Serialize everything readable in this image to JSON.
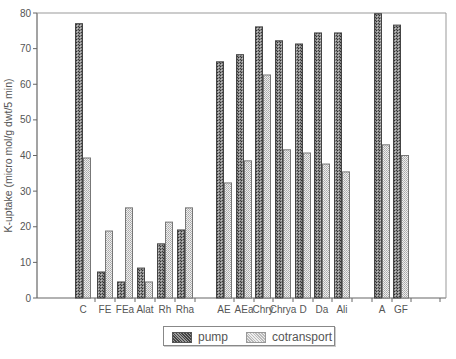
{
  "chart_data": {
    "type": "bar",
    "title": "",
    "xlabel": "",
    "ylabel": "K-uptake (micro mol/g dwt/5 min)",
    "ylim": [
      0,
      80
    ],
    "yticks": [
      0,
      10,
      20,
      30,
      40,
      50,
      60,
      70,
      80
    ],
    "grid": false,
    "legend_position": "bottom",
    "categories": [
      "C",
      "FE",
      "FEa",
      "Alat",
      "Rh",
      "Rha",
      "AE",
      "AEa",
      "Chry",
      "Chrya",
      "D",
      "Da",
      "Ali",
      "A",
      "GF"
    ],
    "series": [
      {
        "name": "pump",
        "values": [
          77,
          7.3,
          4.5,
          8.4,
          15.2,
          19.1,
          66.3,
          68.3,
          76.1,
          72.2,
          71.3,
          74.4,
          74.4,
          79.8,
          76.6
        ]
      },
      {
        "name": "cotransport",
        "values": [
          39.3,
          18.8,
          25.3,
          4.5,
          21.3,
          25.3,
          32.3,
          38.5,
          62.6,
          41.6,
          40.7,
          37.6,
          35.4,
          43.0,
          40.0
        ]
      }
    ]
  },
  "legend": {
    "pump_label": "pump",
    "cotransport_label": "cotransport"
  },
  "colors": {
    "pump_fill": "#555555",
    "cotransport_fill": "#cccccc",
    "axis": "#666666"
  }
}
